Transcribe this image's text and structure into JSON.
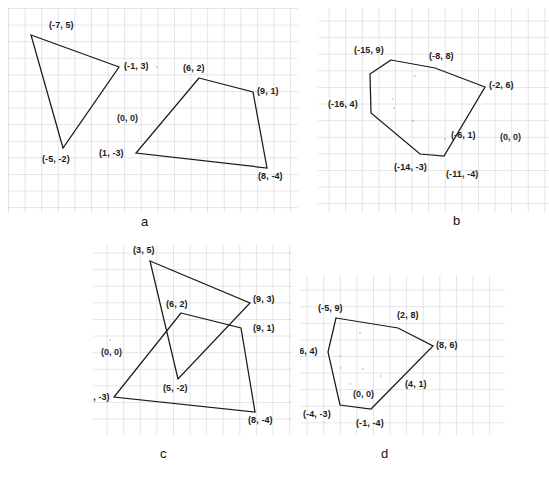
{
  "figure": {
    "background_color": "#ffffff",
    "grid_color": "#aaaab4",
    "stroke_color": "#1a1a1a",
    "text_color": "#1b1b1b"
  },
  "panels": [
    {
      "id": "a",
      "caption": "a",
      "origin_label": "(0, 0)",
      "shapes": [
        {
          "name": "triangle-left",
          "type": "polygon",
          "vertices": [
            {
              "label": "(-7, 5)",
              "x": -7,
              "y": 5
            },
            {
              "label": "(-1, 3)",
              "x": -1,
              "y": 3
            },
            {
              "label": "(-5, -2)",
              "x": -5,
              "y": -2
            }
          ]
        },
        {
          "name": "quadrilateral-right",
          "type": "polygon",
          "vertices": [
            {
              "label": "(6, 2)",
              "x": 6,
              "y": 2
            },
            {
              "label": "(9, 1)",
              "x": 9,
              "y": 1
            },
            {
              "label": "(8, -4)",
              "x": 8,
              "y": -4
            },
            {
              "label": "(1, -3)",
              "x": 1,
              "y": -3
            }
          ]
        }
      ]
    },
    {
      "id": "b",
      "caption": "b",
      "origin_label": "(0, 0)",
      "shapes": [
        {
          "name": "hexagon",
          "type": "polygon",
          "vertices": [
            {
              "label": "(-15, 9)",
              "x": -15,
              "y": 9
            },
            {
              "label": "(-8, 8)",
              "x": -8,
              "y": 8
            },
            {
              "label": "(-2, 6)",
              "x": -2,
              "y": 6
            },
            {
              "label": "(-6, 1)",
              "x": -6,
              "y": 1
            },
            {
              "label": "(-11, -4)",
              "x": -11,
              "y": -4
            },
            {
              "label": "(-14, -3)",
              "x": -14,
              "y": -3
            },
            {
              "label": "(-16, 4)",
              "x": -16,
              "y": 4
            }
          ]
        }
      ]
    },
    {
      "id": "c",
      "caption": "c",
      "origin_label": "(0, 0)",
      "shapes": [
        {
          "name": "triangle-overlap",
          "type": "polygon",
          "vertices": [
            {
              "label": "(3, 5)",
              "x": 3,
              "y": 5
            },
            {
              "label": "(9, 3)",
              "x": 9,
              "y": 3
            },
            {
              "label": "(5, -2)",
              "x": 5,
              "y": -2
            }
          ]
        },
        {
          "name": "quadrilateral-overlap",
          "type": "polygon",
          "vertices": [
            {
              "label": "(6, 2)",
              "x": 6,
              "y": 2
            },
            {
              "label": "(9, 1)",
              "x": 9,
              "y": 1
            },
            {
              "label": "(8, -4)",
              "x": 8,
              "y": -4
            },
            {
              "label": "(1, -3)",
              "x": 1,
              "y": -3
            }
          ]
        }
      ]
    },
    {
      "id": "d",
      "caption": "d",
      "origin_label": "(0, 0)",
      "shapes": [
        {
          "name": "hexagon",
          "type": "polygon",
          "vertices": [
            {
              "label": "(-5, 9)",
              "x": -5,
              "y": 9
            },
            {
              "label": "(2, 8)",
              "x": 2,
              "y": 8
            },
            {
              "label": "(8, 6)",
              "x": 8,
              "y": 6
            },
            {
              "label": "(4, 1)",
              "x": 4,
              "y": 1
            },
            {
              "label": "(-1, -4)",
              "x": -1,
              "y": -4
            },
            {
              "label": "(-4, -3)",
              "x": -4,
              "y": -3
            },
            {
              "label": "(-6, 4)",
              "x": -6,
              "y": 4
            }
          ]
        }
      ]
    }
  ],
  "labels": {
    "a_7_5": "(-7, 5)",
    "a_m1_3": "(-1, 3)",
    "a_m5_m2": "(-5, -2)",
    "a_origin": "(0, 0)",
    "a_6_2": "(6, 2)",
    "a_9_1": "(9, 1)",
    "a_1_m3": "(1, -3)",
    "a_8_m4": "(8, -4)",
    "a_caption": "a",
    "b_m15_9": "(-15, 9)",
    "b_m8_8": "(-8, 8)",
    "b_m2_6": "(-2, 6)",
    "b_m16_4": "(-16, 4)",
    "b_m6_1": "(-6, 1)",
    "b_m14_m3": "(-14, -3)",
    "b_m11_m4": "(-11, -4)",
    "b_origin": "(0, 0)",
    "b_caption": "b",
    "c_3_5": "(3, 5)",
    "c_9_3": "(9, 3)",
    "c_6_2": "(6, 2)",
    "c_9_1": "(9, 1)",
    "c_origin": "(0, 0)",
    "c_5_m2": "(5, -2)",
    "c_1_m3": "(1, -3)",
    "c_8_m4": "(8, -4)",
    "c_caption": "c",
    "d_m5_9": "(-5, 9)",
    "d_2_8": "(2, 8)",
    "d_8_6": "(8, 6)",
    "d_m6_4": "(-6, 4)",
    "d_4_1": "(4, 1)",
    "d_origin": "(0, 0)",
    "d_m4_m3": "(-4, -3)",
    "d_m1_m4": "(-1, -4)",
    "d_caption": "d"
  }
}
